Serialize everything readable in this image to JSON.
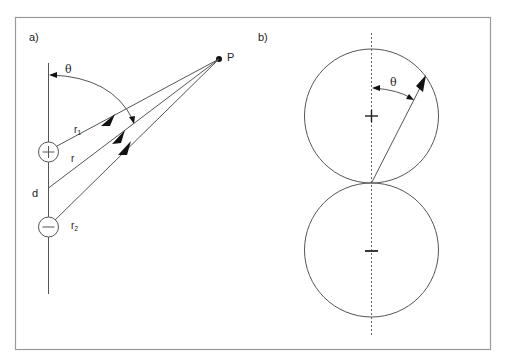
{
  "figure": {
    "panels": [
      {
        "id": "a",
        "label": "a)",
        "point_label": "P",
        "angle_label": "θ",
        "distance_labels": {
          "r1": "r",
          "r1_sub": "1",
          "r": "r",
          "r2": "r",
          "r2_sub": "2"
        },
        "separation_label": "d",
        "charges": [
          {
            "sign": "+",
            "name": "positive-charge"
          },
          {
            "sign": "−",
            "name": "negative-charge"
          }
        ]
      },
      {
        "id": "b",
        "label": "b)",
        "angle_label": "θ",
        "lobes": [
          {
            "sign": "+",
            "name": "upper-lobe"
          },
          {
            "sign": "−",
            "name": "lower-lobe"
          }
        ]
      }
    ],
    "colors": {
      "frame": "#9a9a9a",
      "line": "#555555",
      "ink": "#111111",
      "background": "#ffffff"
    }
  }
}
